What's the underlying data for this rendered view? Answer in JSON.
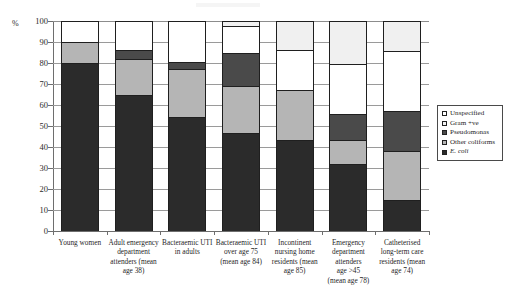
{
  "chart_data": {
    "type": "bar",
    "subtype": "stacked-bar-100-percent",
    "title": "",
    "xlabel": "",
    "ylabel": "%",
    "ylim": [
      0,
      100
    ],
    "ytick_step": 10,
    "yticks": [
      0,
      10,
      20,
      30,
      40,
      50,
      60,
      70,
      80,
      90,
      100
    ],
    "grid": true,
    "grid_axis": "y",
    "legend_position": "right",
    "stack_order_bottom_to_top": [
      "E. coli",
      "Other coliforms",
      "Pseudomonas",
      "Unspecified",
      "Gram +ve"
    ],
    "categories": [
      "Young women",
      "Adult emergency department attenders (mean age 38)",
      "Bacteraemic UTI in adults",
      "Bacteraemic UTI over age 75 (mean age 84)",
      "Incontinent nursing home residents (mean age 85)",
      "Emergency department attenders age >45 (mean age 78)",
      "Catheterised long-term care residents (mean age 74)"
    ],
    "series": [
      {
        "name": "E. coli",
        "color": "#2b2b2b",
        "values": [
          80.0,
          65.0,
          54.5,
          46.5,
          43.5,
          32.0,
          15.0
        ]
      },
      {
        "name": "Other coliforms",
        "color": "#b5b5b5",
        "values": [
          10.0,
          17.0,
          22.5,
          22.5,
          23.5,
          11.5,
          23.0
        ]
      },
      {
        "name": "Pseudomonas",
        "color": "#4a4a4a",
        "values": [
          0.0,
          4.0,
          3.5,
          16.0,
          0.0,
          12.0,
          19.0
        ]
      },
      {
        "name": "Unspecified",
        "color": "#ffffff",
        "values": [
          10.0,
          14.0,
          19.5,
          12.5,
          19.0,
          24.0,
          28.5
        ]
      },
      {
        "name": "Gram +ve",
        "color": "#f0f0f0",
        "values": [
          0.0,
          0.0,
          0.0,
          2.5,
          14.0,
          20.5,
          14.5
        ]
      }
    ],
    "cumulative_tops": [
      {
        "category": "Young women",
        "E. coli": 80.0,
        "Other coliforms": 90.0,
        "Pseudomonas": 90.0,
        "Unspecified": 100.0,
        "Gram +ve": 100.0
      },
      {
        "category": "Adult emergency department attenders (mean age 38)",
        "E. coli": 65.0,
        "Other coliforms": 82.0,
        "Pseudomonas": 86.0,
        "Unspecified": 100.0,
        "Gram +ve": 100.0
      },
      {
        "category": "Bacteraemic UTI in adults",
        "E. coli": 54.5,
        "Other coliforms": 77.0,
        "Pseudomonas": 80.5,
        "Unspecified": 100.0,
        "Gram +ve": 100.0
      },
      {
        "category": "Bacteraemic UTI over age 75 (mean age 84)",
        "E. coli": 46.5,
        "Other coliforms": 69.0,
        "Pseudomonas": 85.0,
        "Unspecified": 97.5,
        "Gram +ve": 100.0
      },
      {
        "category": "Incontinent nursing home residents (mean age 85)",
        "E. coli": 43.5,
        "Other coliforms": 67.0,
        "Pseudomonas": 67.0,
        "Unspecified": 86.0,
        "Gram +ve": 100.0
      },
      {
        "category": "Emergency department attenders age >45 (mean age 78)",
        "E. coli": 32.0,
        "Other coliforms": 43.5,
        "Pseudomonas": 55.5,
        "Unspecified": 79.5,
        "Gram +ve": 100.0
      },
      {
        "category": "Catheterised long-term care residents (mean age 74)",
        "E. coli": 15.0,
        "Other coliforms": 38.0,
        "Pseudomonas": 57.0,
        "Unspecified": 85.5,
        "Gram +ve": 100.0
      }
    ]
  },
  "axis": {
    "y_unit_label": "%",
    "ytick_labels": [
      "100",
      "90",
      "80",
      "70",
      "60",
      "50",
      "40",
      "30",
      "20",
      "10",
      "0"
    ]
  },
  "xlabels": [
    {
      "lines": [
        "Young women"
      ]
    },
    {
      "lines": [
        "Adult emergency",
        "department",
        "attenders (mean",
        "age 38)"
      ]
    },
    {
      "lines": [
        "Bacteraemic UTI",
        "in adults"
      ]
    },
    {
      "lines": [
        "Bacteraemic UTI",
        "over age 75",
        "(mean age 84)"
      ]
    },
    {
      "lines": [
        "Incontinent",
        "nursing home",
        "residents (mean",
        "age 85)"
      ]
    },
    {
      "lines": [
        "Emergency",
        "department",
        "attenders",
        "age >45",
        "(mean age 78)"
      ]
    },
    {
      "lines": [
        "Catheterised",
        "long-term care",
        "residents (mean",
        "age 74)"
      ]
    }
  ],
  "legend": {
    "items": [
      {
        "label": "Unspecified",
        "color": "#ffffff",
        "italic": false
      },
      {
        "label": "Gram +ve",
        "color": "#f2f2f2",
        "italic": false
      },
      {
        "label": "Pseudomonas",
        "color": "#4a4a4a",
        "italic": false
      },
      {
        "label": "Other coliforms",
        "color": "#b5b5b5",
        "italic": false
      },
      {
        "label": "E. coli",
        "color": "#2b2b2b",
        "italic": true
      }
    ]
  }
}
